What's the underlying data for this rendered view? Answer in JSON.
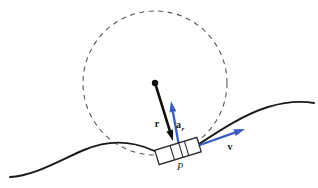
{
  "figure": {
    "type": "physics-diagram",
    "background_color": "#ffffff"
  },
  "colors": {
    "curve": "#1a1a1a",
    "circle_dashed": "#55555a",
    "vector_black": "#111111",
    "vector_blue": "#3b5fc0",
    "block_outline": "#2b2b2b",
    "label_text": "#1a1a1a"
  },
  "circle": {
    "name": "osculating-circle",
    "center_x": 155,
    "center_y": 83,
    "radius": 72,
    "style": "dashed"
  },
  "center_point": {
    "name": "circle-center-dot",
    "x": 155,
    "y": 83,
    "radius": 3.2
  },
  "path_curve": {
    "name": "curved-track",
    "d": "M 10 177 C 34 176 60 160 84 150 C 110 139 132 141 152 150 C 168 157 180 156 196 146 C 216 133 242 115 268 107 C 288 101 302 101 314 103"
  },
  "vectors": [
    {
      "id": "r",
      "name": "position-vector-r",
      "label": "r",
      "subscript": "",
      "color": "#111111",
      "x1": 156,
      "y1": 86,
      "x2": 173,
      "y2": 141,
      "label_x": 157,
      "label_y": 127,
      "head_width": 7,
      "head_length": 11
    },
    {
      "id": "a_r",
      "name": "radial-acceleration-vector",
      "label": "a",
      "subscript": "r",
      "color": "#3b5fc0",
      "x1": 179,
      "y1": 146,
      "x2": 171,
      "y2": 101,
      "label_x": 180,
      "label_y": 128,
      "head_width": 7,
      "head_length": 11
    },
    {
      "id": "v",
      "name": "velocity-vector",
      "label": "v",
      "subscript": "",
      "color": "#3b5fc0",
      "x1": 197,
      "y1": 146,
      "x2": 245,
      "y2": 129,
      "label_x": 230,
      "label_y": 150,
      "head_width": 7,
      "head_length": 11
    }
  ],
  "block": {
    "name": "slider-block-P",
    "center_x": 178,
    "center_y": 151,
    "width": 44,
    "height": 15,
    "rotation_deg": -17,
    "divider_offsets": [
      -6,
      3,
      9
    ]
  },
  "point_label": {
    "name": "point-label-P",
    "text": "P",
    "x": 180,
    "y": 170
  }
}
